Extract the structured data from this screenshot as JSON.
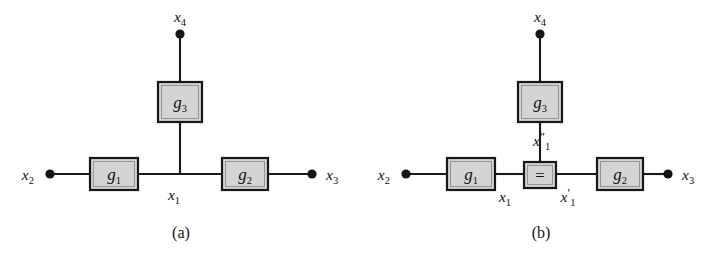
{
  "figure": {
    "background_color": "#ffffff",
    "ink_color": "#141414",
    "box_fill_color": "#d4d4d4",
    "box_stroke_color": "#171717"
  },
  "panels": [
    {
      "id": "a",
      "caption": "(a)",
      "factors": [
        {
          "id": "g1",
          "label": "g",
          "subscript": "1",
          "name": "factor-node-g1"
        },
        {
          "id": "g2",
          "label": "g",
          "subscript": "2",
          "name": "factor-node-g2"
        },
        {
          "id": "g3",
          "label": "g",
          "subscript": "3",
          "name": "factor-node-g3"
        }
      ],
      "variables": [
        {
          "id": "x2",
          "label": "x",
          "subscript": "2",
          "prime": "",
          "terminal": true
        },
        {
          "id": "x3",
          "label": "x",
          "subscript": "3",
          "prime": "",
          "terminal": true
        },
        {
          "id": "x4",
          "label": "x",
          "subscript": "4",
          "prime": "",
          "terminal": true
        },
        {
          "id": "x1",
          "label": "x",
          "subscript": "1",
          "prime": "",
          "terminal": false
        }
      ]
    },
    {
      "id": "b",
      "caption": "(b)",
      "factors": [
        {
          "id": "g1",
          "label": "g",
          "subscript": "1",
          "name": "factor-node-g1"
        },
        {
          "id": "g2",
          "label": "g",
          "subscript": "2",
          "name": "factor-node-g2"
        },
        {
          "id": "g3",
          "label": "g",
          "subscript": "3",
          "name": "factor-node-g3"
        }
      ],
      "equality_node": {
        "id": "eq",
        "glyph": "=",
        "name": "equality-constraint-node"
      },
      "variables": [
        {
          "id": "x2",
          "label": "x",
          "subscript": "2",
          "prime": "",
          "terminal": true
        },
        {
          "id": "x3",
          "label": "x",
          "subscript": "3",
          "prime": "",
          "terminal": true
        },
        {
          "id": "x4",
          "label": "x",
          "subscript": "4",
          "prime": "",
          "terminal": true
        },
        {
          "id": "x1",
          "label": "x",
          "subscript": "1",
          "prime": "",
          "terminal": false
        },
        {
          "id": "x1p",
          "label": "x",
          "subscript": "1",
          "prime": "′",
          "terminal": false
        },
        {
          "id": "x1pp",
          "label": "x",
          "subscript": "1",
          "prime": "″",
          "terminal": false
        }
      ]
    }
  ],
  "labels": {
    "a": {
      "x2": "x",
      "x2_sub": "2",
      "x3": "x",
      "x3_sub": "3",
      "x4": "x",
      "x4_sub": "4",
      "x1": "x",
      "x1_sub": "1",
      "g1": "g",
      "g1_sub": "1",
      "g2": "g",
      "g2_sub": "2",
      "g3": "g",
      "g3_sub": "3",
      "caption": "(a)"
    },
    "b": {
      "x2": "x",
      "x2_sub": "2",
      "x3": "x",
      "x3_sub": "3",
      "x4": "x",
      "x4_sub": "4",
      "x1": "x",
      "x1_sub": "1",
      "x1p": "x",
      "x1p_sub": "1",
      "x1p_prime": "′",
      "x1pp": "x",
      "x1pp_sub": "1",
      "x1pp_prime": "″",
      "g1": "g",
      "g1_sub": "1",
      "g2": "g",
      "g2_sub": "2",
      "g3": "g",
      "g3_sub": "3",
      "equals": "=",
      "caption": "(b)"
    }
  }
}
